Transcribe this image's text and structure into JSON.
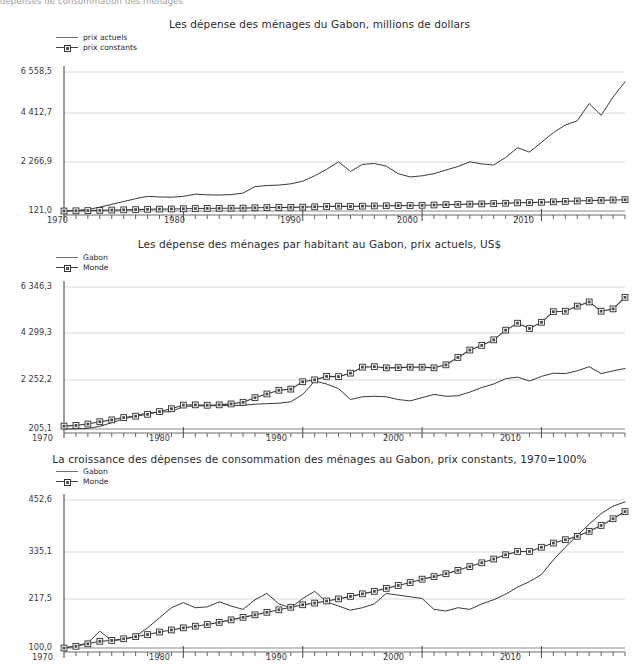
{
  "page": {
    "clipped_header": "dépenses de consommation des ménages   "
  },
  "charts": [
    {
      "title": "Les dépense des ménages du Gabon, millions de dollars",
      "legend": [
        {
          "label": "prix actuels",
          "style": "line"
        },
        {
          "label": "prix constants",
          "style": "line-marker"
        }
      ],
      "y_ticks": [
        "6 558,5",
        "4 412,7",
        "2 266,9",
        "121,0"
      ],
      "x_ticks": [
        "1970",
        "1980",
        "1990",
        "2000",
        "2010"
      ]
    },
    {
      "title": "Les dépense des ménages par habitant au Gabon, prix actuels, US$",
      "legend": [
        {
          "label": "Gabon",
          "style": "line"
        },
        {
          "label": "Monde",
          "style": "line-marker"
        }
      ],
      "y_ticks": [
        "6 346,3",
        "4 299,3",
        "2 252,2",
        "205,1"
      ],
      "x_ticks": [
        "1970",
        "1980",
        "1990",
        "2000",
        "2010"
      ]
    },
    {
      "title": "La croissance des dépenses de consommation des ménages au Gabon, prix constants, 1970=100%",
      "legend": [
        {
          "label": "Gabon",
          "style": "line"
        },
        {
          "label": "Monde",
          "style": "line-marker"
        }
      ],
      "y_ticks": [
        "452,6",
        "335,1",
        "217,5",
        "100,0"
      ],
      "x_ticks": [
        "1970",
        "1980",
        "1990",
        "2000",
        "2010"
      ]
    }
  ],
  "chart_data": [
    {
      "type": "line",
      "title": "Les dépense des ménages du Gabon, millions de dollars",
      "xlabel": "",
      "ylabel": "millions de dollars",
      "ylim": [
        121.0,
        6558.5
      ],
      "yticks": [
        121.0,
        2266.9,
        4412.7,
        6558.5
      ],
      "xlim": [
        1970,
        2017
      ],
      "xticks": [
        1970,
        1980,
        1990,
        2000,
        2010
      ],
      "grid": true,
      "legend_position": "top-left",
      "x": [
        1970,
        1971,
        1972,
        1973,
        1974,
        1975,
        1976,
        1977,
        1978,
        1979,
        1980,
        1981,
        1982,
        1983,
        1984,
        1985,
        1986,
        1987,
        1988,
        1989,
        1990,
        1991,
        1992,
        1993,
        1994,
        1995,
        1996,
        1997,
        1998,
        1999,
        2000,
        2001,
        2002,
        2003,
        2004,
        2005,
        2006,
        2007,
        2008,
        2009,
        2010,
        2011,
        2012,
        2013,
        2014,
        2015,
        2016,
        2017
      ],
      "series": [
        {
          "name": "prix actuels",
          "marker": "none",
          "values": [
            121,
            150,
            190,
            300,
            430,
            560,
            690,
            800,
            770,
            760,
            800,
            900,
            870,
            860,
            880,
            950,
            1250,
            1300,
            1320,
            1380,
            1500,
            1750,
            2050,
            2400,
            1950,
            2280,
            2320,
            2200,
            1850,
            1700,
            1750,
            1850,
            2020,
            2180,
            2400,
            2300,
            2250,
            2600,
            3050,
            2850,
            3300,
            3750,
            4100,
            4300,
            5100,
            4550,
            5400,
            6100
          ]
        },
        {
          "name": "prix constants",
          "marker": "square",
          "values": [
            121,
            130,
            140,
            150,
            165,
            175,
            185,
            200,
            210,
            215,
            225,
            235,
            240,
            245,
            250,
            255,
            270,
            280,
            285,
            290,
            300,
            315,
            330,
            345,
            330,
            345,
            355,
            365,
            370,
            375,
            385,
            400,
            415,
            425,
            440,
            450,
            465,
            480,
            500,
            510,
            525,
            545,
            565,
            585,
            605,
            615,
            630,
            645
          ]
        }
      ]
    },
    {
      "type": "line",
      "title": "Les dépense des ménages par habitant au Gabon, prix actuels, US$",
      "xlabel": "",
      "ylabel": "US$",
      "ylim": [
        205.1,
        6346.3
      ],
      "yticks": [
        205.1,
        2252.2,
        4299.3,
        6346.3
      ],
      "xlim": [
        1970,
        2017
      ],
      "xticks": [
        1970,
        1980,
        1990,
        2000,
        2010
      ],
      "grid": true,
      "legend_position": "top-left",
      "x": [
        1970,
        1971,
        1972,
        1973,
        1974,
        1975,
        1976,
        1977,
        1978,
        1979,
        1980,
        1981,
        1982,
        1983,
        1984,
        1985,
        1986,
        1987,
        1988,
        1989,
        1990,
        1991,
        1992,
        1993,
        1994,
        1995,
        1996,
        1997,
        1998,
        1999,
        2000,
        2001,
        2002,
        2003,
        2004,
        2005,
        2006,
        2007,
        2008,
        2009,
        2010,
        2011,
        2012,
        2013,
        2014,
        2015,
        2016,
        2017
      ],
      "series": [
        {
          "name": "Gabon",
          "marker": "none",
          "values": [
            205,
            215,
            230,
            320,
            480,
            640,
            780,
            900,
            930,
            960,
            1180,
            1200,
            1210,
            1215,
            1220,
            1230,
            1280,
            1300,
            1320,
            1380,
            1700,
            2280,
            2150,
            1950,
            1480,
            1600,
            1620,
            1600,
            1480,
            1420,
            1560,
            1700,
            1620,
            1640,
            1800,
            2000,
            2150,
            2380,
            2450,
            2280,
            2480,
            2620,
            2600,
            2720,
            2900,
            2600,
            2720,
            2820
          ]
        },
        {
          "name": "Monde",
          "marker": "square",
          "values": [
            330,
            360,
            420,
            520,
            600,
            700,
            760,
            840,
            960,
            1080,
            1240,
            1250,
            1230,
            1250,
            1290,
            1360,
            1560,
            1720,
            1880,
            1930,
            2250,
            2330,
            2480,
            2470,
            2620,
            2880,
            2900,
            2850,
            2860,
            2880,
            2880,
            2850,
            2980,
            3300,
            3620,
            3820,
            4060,
            4480,
            4780,
            4550,
            4820,
            5280,
            5300,
            5520,
            5700,
            5300,
            5400,
            5900
          ]
        }
      ]
    },
    {
      "type": "line",
      "title": "La croissance des dépenses de consommation des ménages au Gabon, prix constants, 1970=100%",
      "xlabel": "",
      "ylabel": "1970=100%",
      "ylim": [
        100.0,
        452.6
      ],
      "yticks": [
        100.0,
        217.5,
        335.1,
        452.6
      ],
      "xlim": [
        1970,
        2017
      ],
      "xticks": [
        1970,
        1980,
        1990,
        2000,
        2010
      ],
      "grid": true,
      "legend_position": "top-left",
      "x": [
        1970,
        1971,
        1972,
        1973,
        1974,
        1975,
        1976,
        1977,
        1978,
        1979,
        1980,
        1981,
        1982,
        1983,
        1984,
        1985,
        1986,
        1987,
        1988,
        1989,
        1990,
        1991,
        1992,
        1993,
        1994,
        1995,
        1996,
        1997,
        1998,
        1999,
        2000,
        2001,
        2002,
        2003,
        2004,
        2005,
        2006,
        2007,
        2008,
        2009,
        2010,
        2011,
        2012,
        2013,
        2014,
        2015,
        2016,
        2017
      ],
      "series": [
        {
          "name": "Gabon",
          "marker": "none",
          "values": [
            100,
            105,
            112,
            140,
            118,
            120,
            128,
            148,
            172,
            196,
            208,
            196,
            198,
            210,
            200,
            192,
            215,
            230,
            205,
            196,
            218,
            235,
            210,
            200,
            190,
            196,
            205,
            230,
            226,
            222,
            218,
            192,
            188,
            196,
            192,
            205,
            215,
            228,
            245,
            258,
            275,
            310,
            340,
            368,
            395,
            420,
            438,
            448
          ]
        },
        {
          "name": "Monde",
          "marker": "square",
          "values": [
            100,
            104,
            110,
            116,
            118,
            122,
            127,
            132,
            138,
            143,
            148,
            152,
            156,
            161,
            167,
            173,
            179,
            185,
            191,
            197,
            203,
            207,
            212,
            217,
            223,
            229,
            235,
            242,
            249,
            256,
            264,
            270,
            277,
            285,
            294,
            303,
            312,
            322,
            330,
            330,
            340,
            350,
            358,
            366,
            378,
            392,
            408,
            425
          ]
        }
      ]
    }
  ]
}
